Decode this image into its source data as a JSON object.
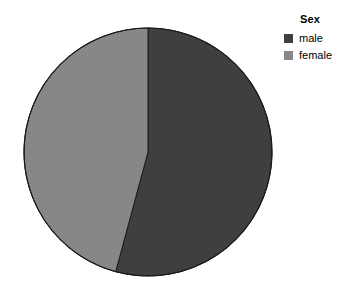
{
  "chart_data": {
    "type": "pie",
    "title": "",
    "legend_title": "Sex",
    "legend_position": "top-right",
    "categories": [
      "male",
      "female"
    ],
    "values": [
      54.2,
      45.8
    ],
    "value_unit": "percent",
    "slice_angles_deg": [
      195.1,
      164.9
    ],
    "colors": [
      "#3f3f3f",
      "#878787"
    ],
    "start_angle_deg": 0,
    "direction": "clockwise",
    "grid": false,
    "series": [
      {
        "name": "Sex",
        "values": [
          54.2,
          45.8
        ]
      }
    ]
  },
  "legend": {
    "title": "Sex",
    "items": [
      {
        "label": "male",
        "color": "#3f3f3f"
      },
      {
        "label": "female",
        "color": "#878787"
      }
    ]
  },
  "canvas": {
    "background": "#ffffff",
    "outline_color": "#1a1a1a"
  }
}
